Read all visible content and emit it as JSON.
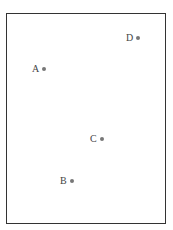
{
  "diagram": {
    "points": [
      {
        "label": "A"
      },
      {
        "label": "B"
      },
      {
        "label": "C"
      },
      {
        "label": "D"
      }
    ]
  }
}
